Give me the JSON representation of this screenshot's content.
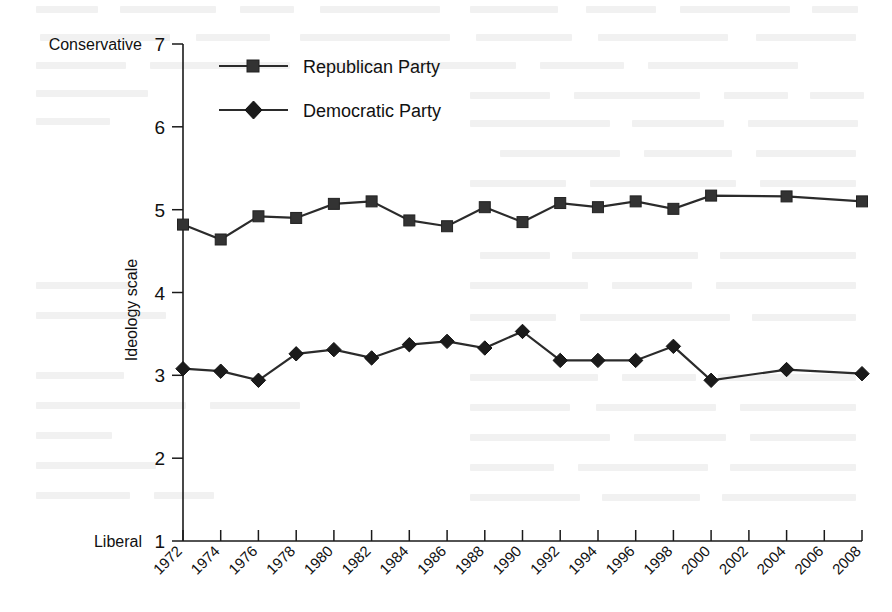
{
  "chart_data": {
    "type": "line",
    "title": "",
    "xlabel": "",
    "ylabel": "Ideology scale",
    "x": [
      1972,
      1974,
      1976,
      1978,
      1980,
      1982,
      1984,
      1986,
      1988,
      1990,
      1992,
      1994,
      1996,
      1998,
      2000,
      2004,
      2008
    ],
    "categories": [
      "1972",
      "1974",
      "1976",
      "1978",
      "1980",
      "1982",
      "1984",
      "1986",
      "1988",
      "1990",
      "1992",
      "1994",
      "1996",
      "1998",
      "2000",
      "2002",
      "2004",
      "2006",
      "2008"
    ],
    "xtick_labels": [
      "1972",
      "1974",
      "1976",
      "1978",
      "1980",
      "1982",
      "1984",
      "1986",
      "1988",
      "1990",
      "1992",
      "1994",
      "1996",
      "1998",
      "2000",
      "2002",
      "2004",
      "2006",
      "2008"
    ],
    "ytick_labels": [
      "1",
      "2",
      "3",
      "4",
      "5",
      "6",
      "7"
    ],
    "yticks": [
      1,
      2,
      3,
      4,
      5,
      6,
      7
    ],
    "ylim": [
      1,
      7
    ],
    "xlim": [
      1972,
      2008
    ],
    "grid": false,
    "legend_position": "top-left",
    "y_axis_low_anchor": "Liberal",
    "y_axis_high_anchor": "Conservative",
    "series": [
      {
        "name": "Republican Party",
        "marker": "square",
        "color": "#333333",
        "x": [
          1972,
          1974,
          1976,
          1978,
          1980,
          1982,
          1984,
          1986,
          1988,
          1990,
          1992,
          1994,
          1996,
          1998,
          2000,
          2004,
          2008
        ],
        "values": [
          4.82,
          4.64,
          4.92,
          4.9,
          5.07,
          5.1,
          4.87,
          4.8,
          5.03,
          4.85,
          5.08,
          5.03,
          5.1,
          5.01,
          5.17,
          5.16,
          5.1
        ]
      },
      {
        "name": "Democratic Party",
        "marker": "diamond",
        "color": "#1b1b1b",
        "x": [
          1972,
          1974,
          1976,
          1978,
          1980,
          1982,
          1984,
          1986,
          1988,
          1990,
          1992,
          1994,
          1996,
          1998,
          2000,
          2004,
          2008
        ],
        "values": [
          3.08,
          3.05,
          2.94,
          3.26,
          3.31,
          3.21,
          3.37,
          3.41,
          3.33,
          3.53,
          3.18,
          3.18,
          3.18,
          3.35,
          2.94,
          3.07,
          3.02
        ]
      }
    ]
  },
  "legend": {
    "items": [
      {
        "label": "Republican Party"
      },
      {
        "label": "Democratic Party"
      }
    ]
  },
  "axis": {
    "y_title": "Ideology scale",
    "top_anchor": "Conservative",
    "bottom_anchor": "Liberal"
  }
}
